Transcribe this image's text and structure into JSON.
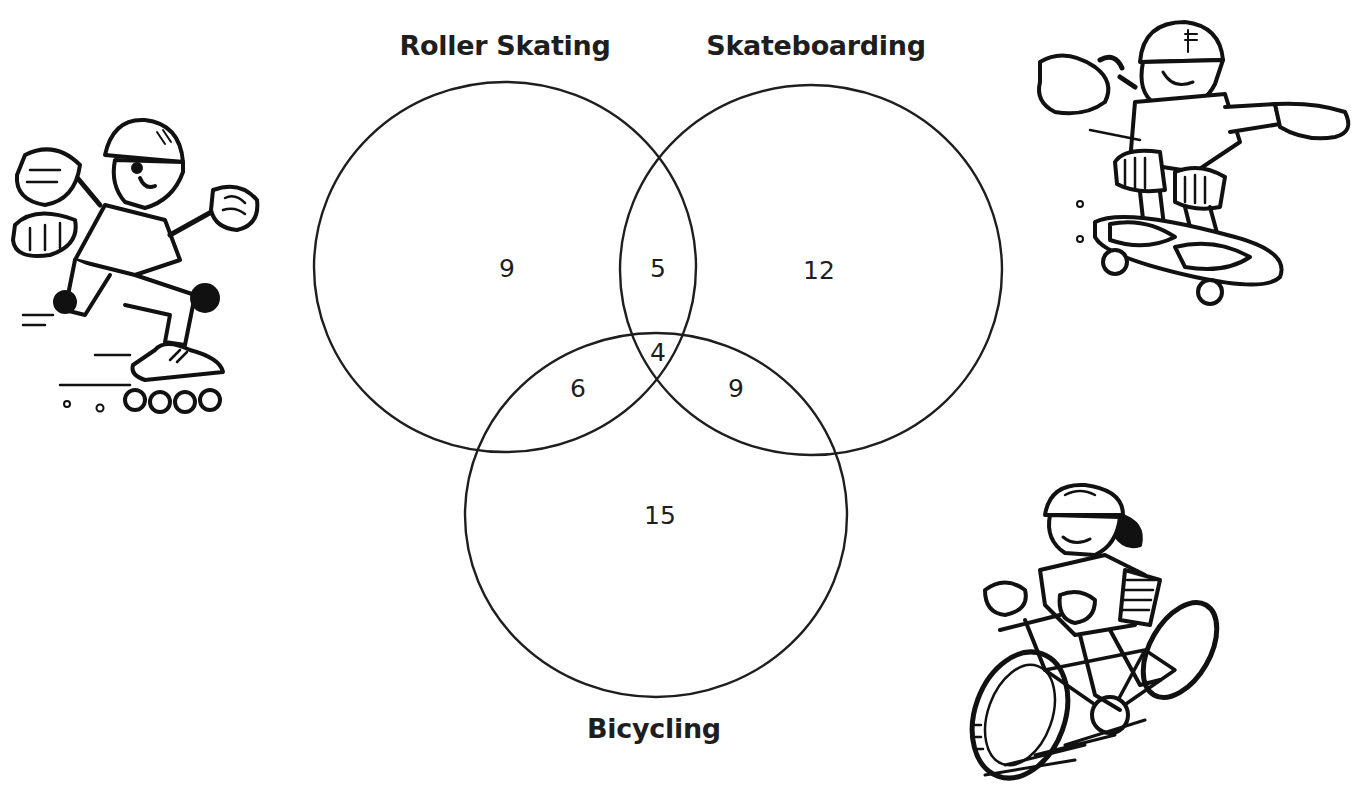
{
  "diagram": {
    "type": "venn-3",
    "sets": [
      {
        "id": "roller",
        "label": "Roller Skating"
      },
      {
        "id": "skate",
        "label": "Skateboarding"
      },
      {
        "id": "bike",
        "label": "Bicycling"
      }
    ],
    "regions": {
      "roller_only": "9",
      "skate_only": "12",
      "bike_only": "15",
      "roller_skate": "5",
      "roller_bike": "6",
      "skate_bike": "9",
      "all_three": "4"
    },
    "colors": {
      "stroke": "#1e1e1e",
      "background": "#ffffff"
    }
  },
  "illustrations": [
    {
      "name": "roller-skater",
      "position": "left"
    },
    {
      "name": "skateboarder",
      "position": "top-right"
    },
    {
      "name": "bicyclist",
      "position": "bottom-right"
    }
  ]
}
